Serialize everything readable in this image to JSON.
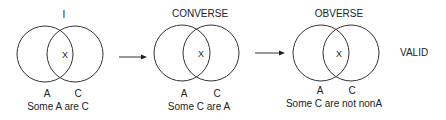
{
  "diagrams": [
    {
      "title": "I",
      "intersection_mark": "X",
      "left_label": "A",
      "right_label": "C",
      "caption": "Some A are C"
    },
    {
      "title": "CONVERSE",
      "intersection_mark": "X",
      "left_label": "A",
      "right_label": "C",
      "caption": "Some C are A"
    },
    {
      "title": "OBVERSE",
      "intersection_mark": "X",
      "left_label": "A",
      "right_label": "C",
      "caption": "Some C are not nonA"
    }
  ],
  "verdict": "VALID",
  "colors": {
    "stroke": "#333333",
    "text": "#222222"
  }
}
